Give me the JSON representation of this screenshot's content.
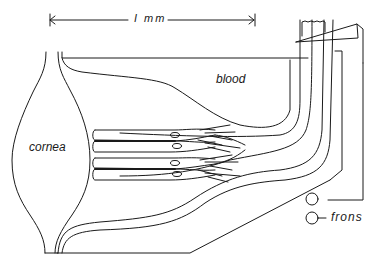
{
  "diagram": {
    "type": "anatomical cross-section",
    "labels": {
      "scale_bar": "I mm",
      "blood": "blood",
      "cornea": "cornea",
      "frons": "frons"
    },
    "stroke_color": "#1a1a1a",
    "background_color": "#ffffff",
    "elements": [
      "scale-bar",
      "cornea-lens",
      "ommatidia-bundle",
      "blood-sinus",
      "nerve-tract",
      "electrode",
      "frons-plate"
    ]
  }
}
